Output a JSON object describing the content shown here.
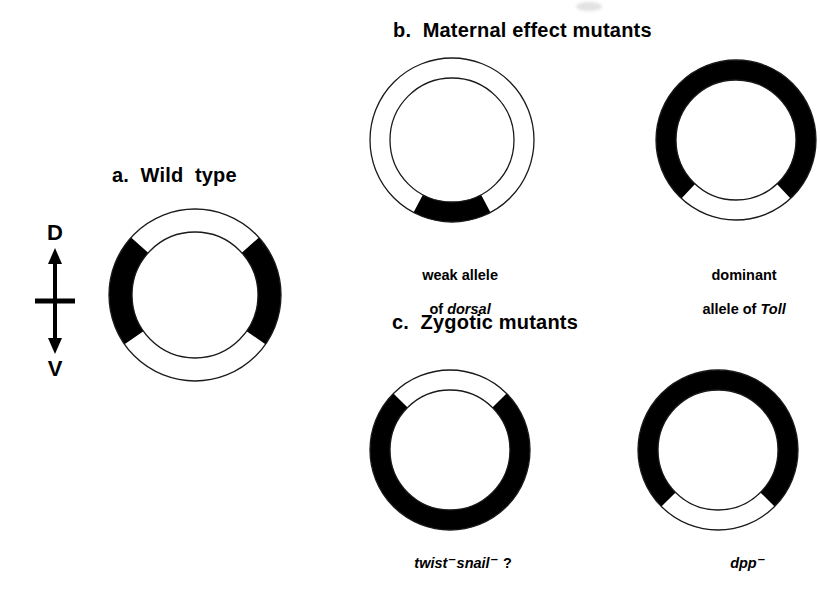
{
  "figure": {
    "background_color": "#ffffff",
    "ink_color": "#000000",
    "outline_color": "#1a1a1a"
  },
  "axis_indicator": {
    "name": "dorsoventral-axis",
    "top_label": "D",
    "bottom_label": "V",
    "arrow_type": "double-headed-vertical-with-crossbar"
  },
  "panels": [
    {
      "id": "a",
      "heading": "a.  Wild  type"
    },
    {
      "id": "b",
      "heading": "b.  Maternal effect mutants"
    },
    {
      "id": "c",
      "heading": "c.  Zygotic mutants"
    }
  ],
  "rings": [
    {
      "name": "wild-type",
      "panel": "a",
      "cx": 195,
      "cy": 295,
      "outer_r": 86,
      "inner_r": 63,
      "base_fill": "#ffffff",
      "arcs": [
        {
          "fill": "#000000",
          "start_deg": 145,
          "end_deg": 222,
          "region": "lateral-left"
        },
        {
          "fill": "#000000",
          "start_deg": -42,
          "end_deg": 35,
          "region": "lateral-right"
        }
      ],
      "caption_lines": []
    },
    {
      "name": "weak-allele-of-dorsal",
      "panel": "b",
      "cx": 452,
      "cy": 140,
      "outer_r": 82,
      "inner_r": 62,
      "base_fill": "#ffffff",
      "arcs": [
        {
          "fill": "#000000",
          "start_deg": 62,
          "end_deg": 118,
          "region": "ventral"
        }
      ],
      "caption_lines": [
        {
          "text": "weak allele",
          "italic": false
        },
        {
          "text": "of ",
          "italic": false,
          "gene": "dorsal"
        }
      ]
    },
    {
      "name": "dominant-allele-of-toll",
      "panel": "b",
      "cx": 736,
      "cy": 140,
      "outer_r": 80,
      "inner_r": 60,
      "base_fill": "#000000",
      "arcs": [
        {
          "fill": "#ffffff",
          "start_deg": 47,
          "end_deg": 133,
          "region": "ventral"
        }
      ],
      "caption_lines": [
        {
          "text": "dominant",
          "italic": false
        },
        {
          "text": "allele of ",
          "italic": false,
          "gene": "Toll"
        }
      ]
    },
    {
      "name": "twist-snail-double-mutant",
      "panel": "c",
      "cx": 450,
      "cy": 450,
      "outer_r": 80,
      "inner_r": 60,
      "base_fill": "#000000",
      "arcs": [
        {
          "fill": "#ffffff",
          "start_deg": -135,
          "end_deg": -45,
          "region": "dorsal"
        }
      ],
      "caption_lines": [
        {
          "text": "twist",
          "italic": true,
          "superscript": "–",
          "text2": "snail",
          "superscript2": "–",
          "suffix": " ?"
        }
      ]
    },
    {
      "name": "dpp-mutant",
      "panel": "c",
      "cx": 718,
      "cy": 450,
      "outer_r": 80,
      "inner_r": 60,
      "base_fill": "#000000",
      "arcs": [
        {
          "fill": "#ffffff",
          "start_deg": 45,
          "end_deg": 135,
          "region": "ventral"
        }
      ],
      "caption_lines": [
        {
          "text": "dpp",
          "italic": true,
          "superscript": "–"
        }
      ]
    }
  ],
  "captions": {
    "dorsal_line1": "weak allele",
    "dorsal_line2_prefix": "of ",
    "dorsal_gene": "dorsal",
    "toll_line1": "dominant",
    "toll_line2_prefix": "allele of ",
    "toll_gene": "Toll",
    "twist_gene1": "twist",
    "twist_gene2": "snail",
    "twist_minus": "–",
    "twist_suffix": " ?",
    "dpp_gene": "dpp",
    "dpp_minus": "–"
  }
}
